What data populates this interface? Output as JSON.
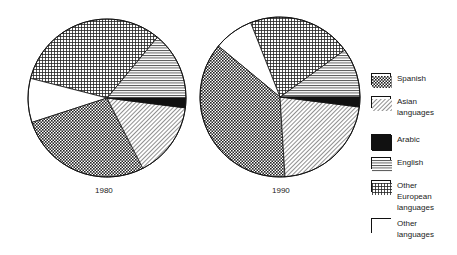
{
  "chart_data": {
    "type": "pie",
    "title": "",
    "legend_position": "right",
    "legend": [
      "Spanish",
      "Asian languages",
      "Arabic",
      "English",
      "Other European languages",
      "Other languages"
    ],
    "charts": [
      {
        "label": "1980",
        "slices": [
          {
            "name": "English",
            "value": 14,
            "pattern": "hlines"
          },
          {
            "name": "Other European languages",
            "value": 32,
            "pattern": "grid"
          },
          {
            "name": "Other languages",
            "value": 9,
            "pattern": "white"
          },
          {
            "name": "Spanish",
            "value": 27.5,
            "pattern": "checker"
          },
          {
            "name": "Asian languages",
            "value": 15.5,
            "pattern": "diag"
          },
          {
            "name": "Arabic",
            "value": 2,
            "pattern": "black"
          }
        ]
      },
      {
        "label": "1990",
        "slices": [
          {
            "name": "English",
            "value": 10,
            "pattern": "hlines"
          },
          {
            "name": "Other European languages",
            "value": 21,
            "pattern": "grid"
          },
          {
            "name": "Other languages",
            "value": 8,
            "pattern": "white"
          },
          {
            "name": "Spanish",
            "value": 37,
            "pattern": "checker"
          },
          {
            "name": "Asian languages",
            "value": 22,
            "pattern": "diag"
          },
          {
            "name": "Arabic",
            "value": 2,
            "pattern": "black"
          }
        ]
      }
    ]
  },
  "labels": {
    "year1": "1980",
    "year2": "1990"
  },
  "legend": [
    {
      "label": "Spanish",
      "pattern": "checker",
      "top": 73
    },
    {
      "label": "Asian\nlanguages",
      "pattern": "diag",
      "top": 96
    },
    {
      "label": "Arabic",
      "pattern": "black",
      "top": 134
    },
    {
      "label": "English",
      "pattern": "hlines",
      "top": 157
    },
    {
      "label": "Other\nEuropean\nlanguages",
      "pattern": "grid",
      "top": 180
    },
    {
      "label": "Other\nlanguages",
      "pattern": "white",
      "top": 218
    }
  ]
}
